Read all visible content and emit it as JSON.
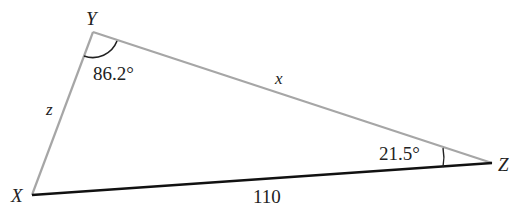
{
  "diagram": {
    "type": "triangle",
    "vertices": {
      "X": {
        "label": "X",
        "x": 32,
        "y": 195
      },
      "Y": {
        "label": "Y",
        "x": 93,
        "y": 32
      },
      "Z": {
        "label": "Z",
        "x": 492,
        "y": 163
      }
    },
    "sides": {
      "XY": {
        "label": "z",
        "color": "#a6a6a6"
      },
      "YZ": {
        "label": "x",
        "color": "#a6a6a6"
      },
      "XZ": {
        "label": "110",
        "color": "#111111"
      }
    },
    "angles": {
      "Y": {
        "label": "86.2°"
      },
      "Z": {
        "label": "21.5°"
      }
    }
  }
}
